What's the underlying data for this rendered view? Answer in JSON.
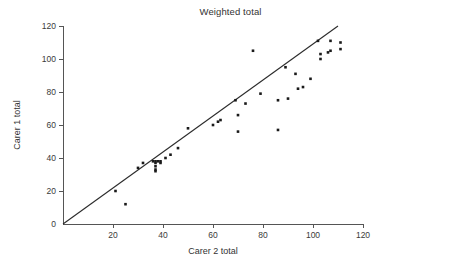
{
  "chart_data": {
    "type": "scatter",
    "title": "Weighted total",
    "xlabel": "Carer 2 total",
    "ylabel": "Carer 1 total",
    "xlim": [
      0,
      120
    ],
    "ylim": [
      0,
      120
    ],
    "xticks": [
      0,
      20,
      40,
      60,
      80,
      100,
      120
    ],
    "yticks": [
      0,
      20,
      40,
      60,
      80,
      100,
      120
    ],
    "xticklabels": [
      "",
      "20",
      "40",
      "60",
      "80",
      "100",
      "120"
    ],
    "yticklabels": [
      "0",
      "20",
      "40",
      "60",
      "80",
      "100",
      "120"
    ],
    "grid": false,
    "legend": false,
    "point_color": "#1a1a1a",
    "line_color": "#2b2b2b",
    "reference_line": {
      "name": "line of equality",
      "x": [
        0,
        110
      ],
      "y": [
        0,
        120
      ],
      "slope": 1.09,
      "intercept": 0
    },
    "series": [
      {
        "name": "Carer pairs",
        "points": [
          [
            21,
            20
          ],
          [
            25,
            12
          ],
          [
            30,
            34
          ],
          [
            32,
            37
          ],
          [
            36,
            38
          ],
          [
            37,
            38
          ],
          [
            37,
            37
          ],
          [
            37,
            35
          ],
          [
            37,
            33
          ],
          [
            37,
            32
          ],
          [
            38,
            38
          ],
          [
            39,
            38
          ],
          [
            39,
            37
          ],
          [
            41,
            40
          ],
          [
            43,
            42
          ],
          [
            46,
            46
          ],
          [
            50,
            58
          ],
          [
            60,
            60
          ],
          [
            62,
            62
          ],
          [
            63,
            63
          ],
          [
            69,
            75
          ],
          [
            70,
            66
          ],
          [
            70,
            56
          ],
          [
            73,
            73
          ],
          [
            76,
            105
          ],
          [
            79,
            79
          ],
          [
            86,
            75
          ],
          [
            86,
            57
          ],
          [
            89,
            95
          ],
          [
            90,
            76
          ],
          [
            93,
            91
          ],
          [
            94,
            82
          ],
          [
            96,
            83
          ],
          [
            99,
            88
          ],
          [
            102,
            111
          ],
          [
            103,
            103
          ],
          [
            103,
            100
          ],
          [
            106,
            104
          ],
          [
            107,
            111
          ],
          [
            107,
            105
          ],
          [
            111,
            110
          ],
          [
            111,
            106
          ]
        ]
      }
    ]
  }
}
